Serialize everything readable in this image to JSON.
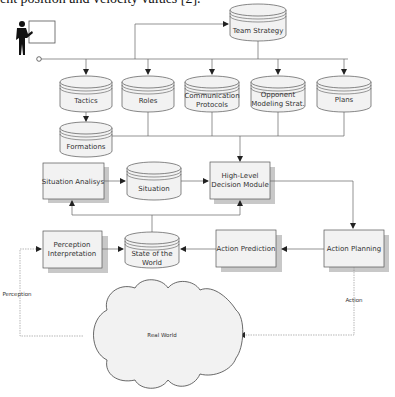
{
  "caption": "ent position and velocity values [2].",
  "diagram": {
    "actor": {
      "label": ""
    },
    "team_strategy": {
      "label": "Team Strategy"
    },
    "knowledge_stores": [
      {
        "label": "Tactics"
      },
      {
        "label": "Roles"
      },
      {
        "label_line1": "Communication",
        "label_line2": "Protocols"
      },
      {
        "label_line1": "Opponent",
        "label_line2": "Modeling Strat."
      },
      {
        "label": "Plans"
      }
    ],
    "formations": {
      "label": "Formations"
    },
    "situation_analysis": {
      "label": "Situation Analisys"
    },
    "situation": {
      "label": "Situation"
    },
    "high_level_decision": {
      "label_line1": "High-Level",
      "label_line2": "Decision Module"
    },
    "perception_interpretation": {
      "label_line1": "Perception",
      "label_line2": "Interpretation"
    },
    "state_of_world": {
      "label_line1": "State of the",
      "label_line2": "World"
    },
    "action_prediction": {
      "label": "Action Prediction"
    },
    "action_planning": {
      "label": "Action Planning"
    },
    "real_world": {
      "label": "Real World"
    },
    "edge_labels": {
      "perception": "Perception",
      "action": "Action"
    },
    "colors": {
      "fill": "#f2f2f2",
      "shadow": "#c8c8c8",
      "stroke": "#555555",
      "line": "#666666"
    }
  }
}
